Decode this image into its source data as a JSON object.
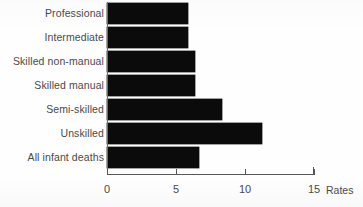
{
  "chart_data": {
    "type": "bar",
    "orientation": "horizontal",
    "title": "",
    "xlabel": "Rates",
    "ylabel": "",
    "categories": [
      "Professional",
      "Intermediate",
      "Skilled non-manual",
      "Skilled manual",
      "Semi-skilled",
      "Unskilled",
      "All infant deaths"
    ],
    "values": [
      5.9,
      5.9,
      6.4,
      6.4,
      8.3,
      11.2,
      6.7
    ],
    "xlim": [
      0,
      15
    ],
    "x_ticks": [
      0,
      5,
      10,
      15
    ],
    "x_tick_labels": [
      "0",
      "5",
      "10",
      "15"
    ],
    "grid": false,
    "legend": null,
    "bar_color": "#0b0b0b",
    "label_color": "#4a4a4a",
    "axis_color": "#575757"
  },
  "axis": {
    "title": "Rates",
    "ticks": [
      {
        "label": "0",
        "value": 0
      },
      {
        "label": "5",
        "value": 5
      },
      {
        "label": "10",
        "value": 10
      },
      {
        "label": "15",
        "value": 15
      }
    ]
  }
}
